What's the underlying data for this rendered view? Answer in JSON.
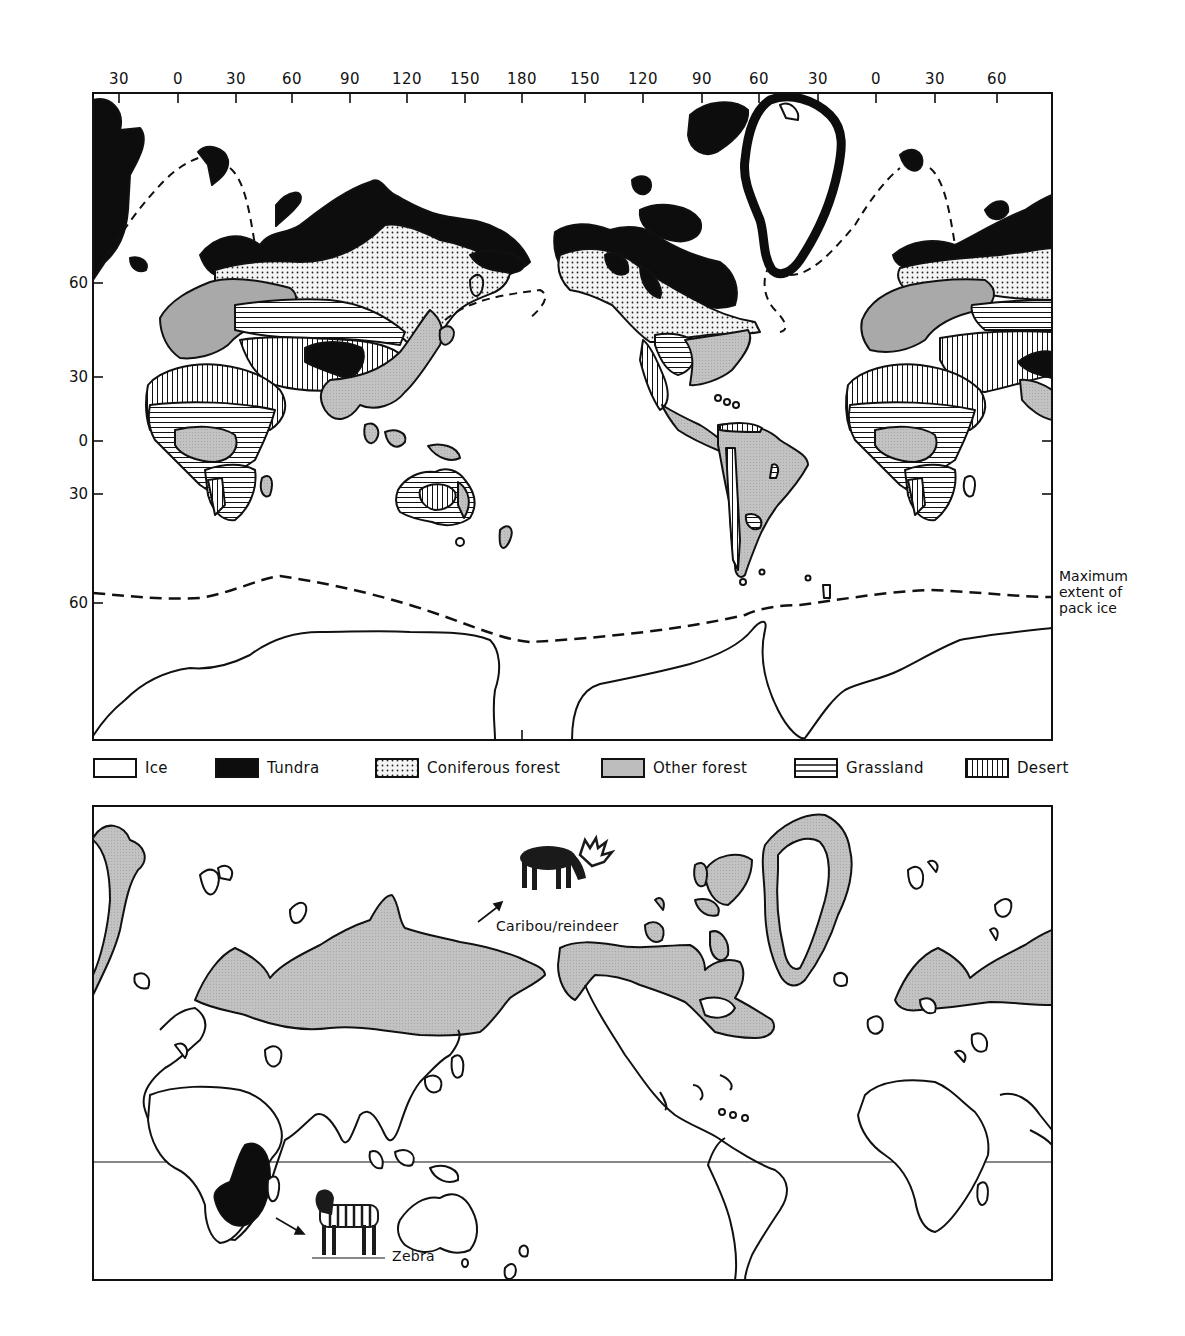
{
  "top_map": {
    "title": "World biomes",
    "longitude_ticks": [
      {
        "label": "30",
        "x": 119
      },
      {
        "label": "0",
        "x": 178
      },
      {
        "label": "30",
        "x": 236
      },
      {
        "label": "60",
        "x": 292
      },
      {
        "label": "90",
        "x": 350
      },
      {
        "label": "120",
        "x": 407
      },
      {
        "label": "150",
        "x": 465
      },
      {
        "label": "180",
        "x": 522
      },
      {
        "label": "150",
        "x": 585
      },
      {
        "label": "120",
        "x": 643
      },
      {
        "label": "90",
        "x": 702
      },
      {
        "label": "60",
        "x": 759
      },
      {
        "label": "30",
        "x": 818
      },
      {
        "label": "0",
        "x": 876
      },
      {
        "label": "30",
        "x": 935
      },
      {
        "label": "60",
        "x": 997
      }
    ],
    "latitude_ticks": [
      {
        "label": "60",
        "y": 283
      },
      {
        "label": "30",
        "y": 377
      },
      {
        "label": "0",
        "y": 441
      },
      {
        "label": "30",
        "y": 494
      },
      {
        "label": "60",
        "y": 603
      }
    ],
    "pack_ice_note": [
      "Maximum",
      "extent of",
      "pack ice"
    ]
  },
  "legend": {
    "items": [
      {
        "key": "ice",
        "label": "Ice",
        "fill": "#ffffff"
      },
      {
        "key": "tundra",
        "label": "Tundra",
        "fill": "#0d0d0d"
      },
      {
        "key": "coniferous",
        "label": "Coniferous forest",
        "fill": "dots"
      },
      {
        "key": "other_forest",
        "label": "Other forest",
        "fill": "#bdbdbd"
      },
      {
        "key": "grassland",
        "label": "Grassland",
        "fill": "horizontal-lines"
      },
      {
        "key": "desert",
        "label": "Desert",
        "fill": "vertical-lines"
      }
    ]
  },
  "bottom_map": {
    "title": "Species ranges",
    "caribou_label": "Caribou/reindeer",
    "zebra_label": "Zebra",
    "caribou_range_color": "#c8c8c8",
    "zebra_range_color": "#0d0d0d"
  },
  "colors": {
    "ink": "#111111",
    "tundra": "#0d0d0d",
    "other_forest": "#bdbdbd",
    "paper": "#ffffff"
  }
}
